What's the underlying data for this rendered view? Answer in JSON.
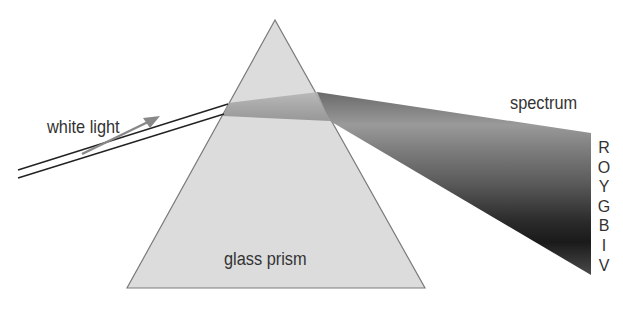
{
  "labels": {
    "white_light": "white light",
    "glass_prism": "glass prism",
    "spectrum": "spectrum"
  },
  "spectrum_colors": [
    "R",
    "O",
    "Y",
    "G",
    "B",
    "I",
    "V"
  ],
  "colors": {
    "prism_fill": "#dcdcdc",
    "prism_edge": "#7a7a7a",
    "ray": "#222222",
    "arrow": "#888888",
    "text": "#333333"
  }
}
